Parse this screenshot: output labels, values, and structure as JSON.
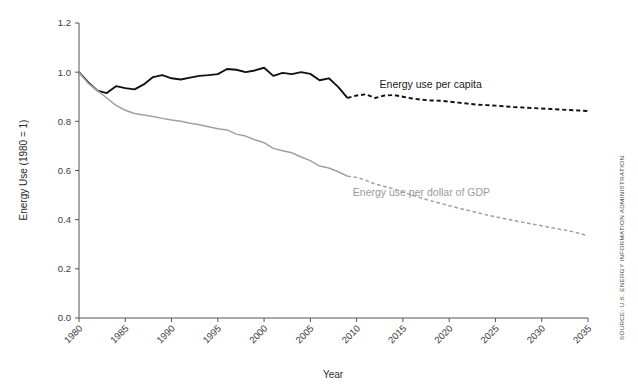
{
  "chart_data": {
    "type": "line",
    "title": "",
    "xlabel": "Year",
    "ylabel": "Energy Use (1980 = 1)",
    "xlim": [
      1980,
      2035
    ],
    "ylim": [
      0.0,
      1.2
    ],
    "grid": false,
    "legend_position": "inline-annotation",
    "xticks": [
      1980,
      1985,
      1990,
      1995,
      2000,
      2005,
      2010,
      2015,
      2020,
      2025,
      2030,
      2035
    ],
    "xtick_labels": [
      "1980",
      "1985",
      "1990",
      "1995",
      "2000",
      "2005",
      "2010",
      "2015",
      "2020",
      "2025",
      "2030",
      "2035"
    ],
    "yticks": [
      0.0,
      0.2,
      0.4,
      0.6,
      0.8,
      1.0,
      1.2
    ],
    "ytick_labels": [
      "0.0",
      "0.2",
      "0.4",
      "0.6",
      "0.8",
      "1.0",
      "1.2"
    ],
    "history_projection_split_year": 2009,
    "annotations": [
      {
        "name": "energy-use-per-capita-label",
        "text": "Energy use per capita",
        "x": 2018,
        "y": 0.935,
        "color": "#1a1a1a"
      },
      {
        "name": "energy-use-per-dollar-gdp-label",
        "text": "Energy use per dollar of GDP",
        "x": 2017,
        "y": 0.495,
        "color": "#9a9a9a"
      }
    ],
    "source": "SOURCE: U.S. ENERGY INFORMATION ADMINISTRATION.",
    "x": [
      1980,
      1981,
      1982,
      1983,
      1984,
      1985,
      1986,
      1987,
      1988,
      1989,
      1990,
      1991,
      1992,
      1993,
      1994,
      1995,
      1996,
      1997,
      1998,
      1999,
      2000,
      2001,
      2002,
      2003,
      2004,
      2005,
      2006,
      2007,
      2008,
      2009,
      2010,
      2011,
      2012,
      2013,
      2014,
      2015,
      2016,
      2017,
      2018,
      2019,
      2020,
      2021,
      2022,
      2023,
      2024,
      2025,
      2026,
      2027,
      2028,
      2029,
      2030,
      2031,
      2032,
      2033,
      2034,
      2035
    ],
    "series": [
      {
        "name": "Energy use per capita",
        "color": "#111111",
        "style_history": "solid",
        "style_projection": "dashed",
        "values": [
          1.0,
          0.958,
          0.925,
          0.915,
          0.943,
          0.935,
          0.93,
          0.95,
          0.98,
          0.988,
          0.975,
          0.97,
          0.978,
          0.985,
          0.988,
          0.992,
          1.013,
          1.01,
          1.0,
          1.007,
          1.018,
          0.985,
          0.997,
          0.992,
          1.0,
          0.993,
          0.967,
          0.975,
          0.94,
          0.895,
          0.905,
          0.91,
          0.895,
          0.905,
          0.907,
          0.9,
          0.893,
          0.888,
          0.885,
          0.884,
          0.88,
          0.876,
          0.872,
          0.868,
          0.866,
          0.864,
          0.861,
          0.858,
          0.856,
          0.854,
          0.852,
          0.85,
          0.848,
          0.846,
          0.844,
          0.842
        ]
      },
      {
        "name": "Energy use per dollar of GDP",
        "color": "#a0a0a0",
        "style_history": "solid",
        "style_projection": "dashed",
        "values": [
          1.0,
          0.955,
          0.925,
          0.895,
          0.865,
          0.845,
          0.832,
          0.826,
          0.82,
          0.812,
          0.805,
          0.8,
          0.792,
          0.786,
          0.778,
          0.77,
          0.765,
          0.748,
          0.74,
          0.725,
          0.713,
          0.69,
          0.68,
          0.672,
          0.655,
          0.64,
          0.618,
          0.61,
          0.595,
          0.577,
          0.572,
          0.56,
          0.545,
          0.535,
          0.525,
          0.512,
          0.5,
          0.488,
          0.477,
          0.467,
          0.457,
          0.447,
          0.438,
          0.429,
          0.42,
          0.412,
          0.404,
          0.396,
          0.389,
          0.382,
          0.375,
          0.368,
          0.361,
          0.354,
          0.345,
          0.335
        ]
      }
    ]
  }
}
